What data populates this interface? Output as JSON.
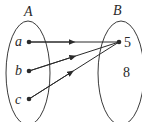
{
  "diagram": {
    "type": "function-mapping",
    "sets": [
      {
        "name": "A",
        "elements": [
          "a",
          "b",
          "c"
        ]
      },
      {
        "name": "B",
        "elements": [
          "5",
          "8"
        ]
      }
    ],
    "mappings": [
      {
        "from": "a",
        "to": "5"
      },
      {
        "from": "b",
        "to": "5"
      },
      {
        "from": "c",
        "to": "5"
      }
    ],
    "colors": {
      "stroke": "#3a3a3a",
      "text": "#2a2a2a",
      "background": "#ffffff"
    }
  }
}
